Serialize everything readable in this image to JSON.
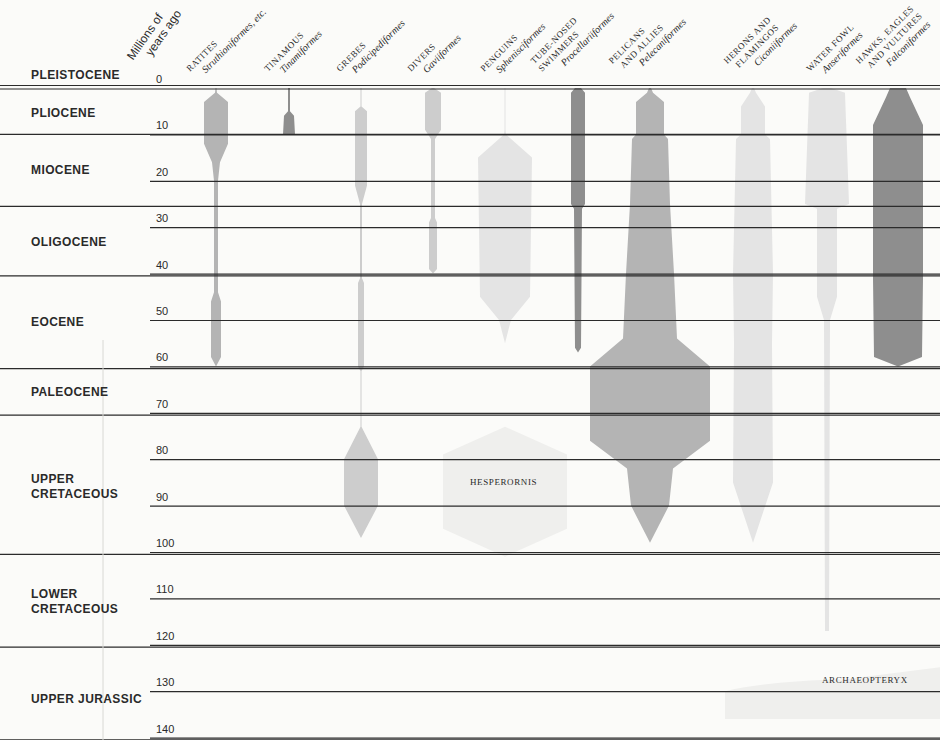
{
  "axis": {
    "title_line1": "Millions of",
    "title_line2": "years ago",
    "ticks": [
      0,
      10,
      20,
      30,
      40,
      50,
      60,
      70,
      80,
      90,
      100,
      110,
      120,
      130,
      140
    ],
    "y_scale": {
      "y0_px": 88,
      "px_per_my": 4.64
    }
  },
  "epochs": [
    {
      "name": "PLEISTOCENE",
      "label_y": 68
    },
    {
      "name": "PLIOCENE",
      "label_y": 106
    },
    {
      "name": "MIOCENE",
      "label_y": 163
    },
    {
      "name": "OLIGOCENE",
      "label_y": 235
    },
    {
      "name": "EOCENE",
      "label_y": 315
    },
    {
      "name": "PALEOCENE",
      "label_y": 385
    },
    {
      "name": "UPPER\nCRETACEOUS",
      "label_y": 472
    },
    {
      "name": "LOWER\nCRETACEOUS",
      "label_y": 587
    },
    {
      "name": "UPPER JURASSIC",
      "label_y": 692
    }
  ],
  "epoch_boundaries_my": [
    0,
    10,
    25.5,
    40.5,
    60.5,
    70.5,
    100.5,
    120.5,
    140.5
  ],
  "orders": [
    {
      "common": "RATITES",
      "sci": "Struthioniformes, etc.",
      "x": 216,
      "label_x": 200
    },
    {
      "common": "TINAMOUS",
      "sci": "Tinamiformes",
      "x": 289,
      "label_x": 278
    },
    {
      "common": "GREBES",
      "sci": "Podicipediformes",
      "x": 361,
      "label_x": 350
    },
    {
      "common": "DIVERS",
      "sci": "Gaviiformes",
      "x": 433,
      "label_x": 421
    },
    {
      "common": "PENGUINS",
      "sci": "Sphenisciformes",
      "x": 505,
      "label_x": 494
    },
    {
      "common": "TUBE-NOSED\nSWIMMERS",
      "sci": "Procellariiformes",
      "x": 578,
      "label_x": 552
    },
    {
      "common": "PELICANS\n  AND ALLIES",
      "sci": "Pelecaniformes",
      "x": 650,
      "label_x": 630
    },
    {
      "common": "HERONS AND\n  FLAMINGOS",
      "sci": "Ciconiiformes",
      "x": 753,
      "label_x": 745
    },
    {
      "common": "WATER FOWL",
      "sci": "Anseriformes",
      "x": 827,
      "label_x": 820
    },
    {
      "common": "HAWKS, EAGLES\n  AND VULTURES",
      "sci": "Falconiformes",
      "x": 898,
      "label_x": 877
    }
  ],
  "fossils": [
    {
      "name": "HESPERORNIS",
      "x": 470,
      "y": 483
    },
    {
      "name": "ARCHAEOPTERYX",
      "x": 822,
      "y": 681
    }
  ],
  "colors": {
    "line": "#2b2b2b",
    "dark": "#8e8e8e",
    "medium": "#b4b4b4",
    "light": "#cdcdcd",
    "pale": "#e4e4e4",
    "ghost": "#efefed"
  },
  "chart_data": {
    "type": "area",
    "ylabel": "Millions of years ago",
    "ylim": [
      0,
      140
    ],
    "y_ticks": [
      0,
      10,
      20,
      30,
      40,
      50,
      60,
      70,
      80,
      90,
      100,
      110,
      120,
      130,
      140
    ],
    "grid": true,
    "epochs": [
      "Pleistocene",
      "Pliocene",
      "Miocene",
      "Oligocene",
      "Eocene",
      "Paleocene",
      "Upper Cretaceous",
      "Lower Cretaceous",
      "Upper Jurassic"
    ],
    "series": [
      {
        "name": "Ratites (Struthioniformes, etc.)",
        "shade": "medium",
        "profile_my_halfwidth": [
          [
            0,
            0.5
          ],
          [
            1,
            1
          ],
          [
            3,
            12
          ],
          [
            10,
            12
          ],
          [
            12,
            12
          ],
          [
            16,
            4
          ],
          [
            20,
            2
          ],
          [
            44,
            2
          ],
          [
            46,
            5
          ],
          [
            58,
            5
          ],
          [
            60,
            0
          ]
        ]
      },
      {
        "name": "Tinamous (Tinamiformes)",
        "shade": "dark",
        "profile_my_halfwidth": [
          [
            0,
            1
          ],
          [
            5,
            1
          ],
          [
            6,
            5
          ],
          [
            10,
            6
          ],
          [
            10,
            0
          ]
        ]
      },
      {
        "name": "Grebes (Podicipediformes)",
        "shade": "light",
        "profile_my_halfwidth": [
          [
            0,
            0.5
          ],
          [
            4,
            0.5
          ],
          [
            5,
            6
          ],
          [
            21,
            6
          ],
          [
            25,
            1
          ],
          [
            41,
            1
          ],
          [
            42,
            3
          ],
          [
            60,
            3
          ],
          [
            61,
            0.5
          ],
          [
            73,
            0.5
          ],
          [
            80,
            17
          ],
          [
            90,
            17
          ],
          [
            97,
            0
          ]
        ]
      },
      {
        "name": "Divers (Gaviiformes)",
        "shade": "light",
        "profile_my_halfwidth": [
          [
            0,
            1
          ],
          [
            1,
            8
          ],
          [
            9,
            8
          ],
          [
            11,
            2
          ],
          [
            28,
            2
          ],
          [
            29,
            4
          ],
          [
            39,
            4
          ],
          [
            40,
            0
          ]
        ]
      },
      {
        "name": "Penguins (Sphenisciformes)",
        "shade": "pale",
        "profile_my_halfwidth": [
          [
            0,
            0.5
          ],
          [
            9,
            0.5
          ],
          [
            10,
            1
          ],
          [
            15,
            27
          ],
          [
            45,
            25
          ],
          [
            50,
            6
          ],
          [
            55,
            0
          ]
        ]
      },
      {
        "name": "Tube-nosed swimmers (Procellariiformes)",
        "shade": "dark",
        "profile_my_halfwidth": [
          [
            0,
            3
          ],
          [
            1,
            7
          ],
          [
            25,
            7
          ],
          [
            26,
            4
          ],
          [
            56,
            3
          ],
          [
            57,
            0
          ]
        ]
      },
      {
        "name": "Pelicans and allies (Pelecaniformes)",
        "shade": "medium",
        "profile_my_halfwidth": [
          [
            0,
            1
          ],
          [
            1,
            3
          ],
          [
            3,
            14
          ],
          [
            10,
            14
          ],
          [
            11,
            18
          ],
          [
            25,
            20
          ],
          [
            40,
            24
          ],
          [
            54,
            27
          ],
          [
            60,
            60
          ],
          [
            76,
            60
          ],
          [
            82,
            23
          ],
          [
            90,
            19
          ],
          [
            98,
            0
          ]
        ]
      },
      {
        "name": "Herons and flamingos (Ciconiiformes)",
        "shade": "pale",
        "profile_my_halfwidth": [
          [
            0,
            1
          ],
          [
            1,
            3
          ],
          [
            4,
            12
          ],
          [
            10,
            12
          ],
          [
            11,
            17
          ],
          [
            40,
            20
          ],
          [
            55,
            19
          ],
          [
            85,
            20
          ],
          [
            98,
            0
          ]
        ]
      },
      {
        "name": "Water fowl (Anseriformes)",
        "shade": "pale",
        "profile_my_halfwidth": [
          [
            0,
            4
          ],
          [
            1,
            18
          ],
          [
            25,
            22
          ],
          [
            26,
            10
          ],
          [
            45,
            10
          ],
          [
            50,
            3
          ],
          [
            117,
            2
          ]
        ]
      },
      {
        "name": "Hawks, eagles and vultures (Falconiformes)",
        "shade": "dark",
        "profile_my_halfwidth": [
          [
            0,
            8
          ],
          [
            2,
            12
          ],
          [
            8,
            25
          ],
          [
            40,
            25
          ],
          [
            41,
            25
          ],
          [
            58,
            24
          ],
          [
            60,
            0
          ]
        ]
      },
      {
        "name": "Hesperornis",
        "shade": "ghost",
        "profile_my_halfwidth": [
          [
            73,
            0
          ],
          [
            79,
            62
          ],
          [
            95,
            62
          ],
          [
            101,
            0
          ]
        ]
      },
      {
        "name": "Archaeopteryx",
        "shade": "ghost",
        "range_my": [
          127,
          136
        ],
        "x_range_px": [
          725,
          940
        ]
      }
    ]
  }
}
